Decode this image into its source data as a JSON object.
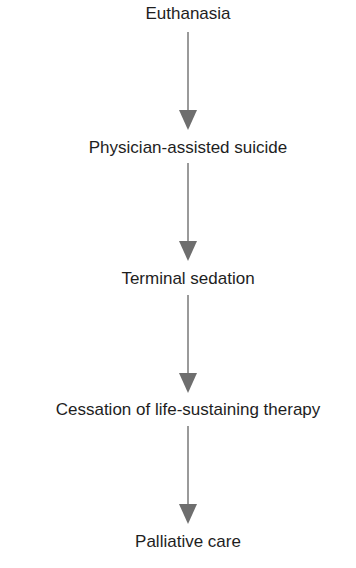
{
  "diagram": {
    "type": "vertical-flow",
    "colors": {
      "text": "#1e1e1e",
      "arrow_line": "#9a9a9a",
      "arrow_head": "#6e6e6e",
      "background": "#ffffff"
    },
    "nodes": [
      {
        "id": "euthanasia",
        "label": "Euthanasia"
      },
      {
        "id": "physician-assisted-suicide",
        "label": "Physician-assisted suicide"
      },
      {
        "id": "terminal-sedation",
        "label": "Terminal sedation"
      },
      {
        "id": "cessation-of-life-sustaining-therapy",
        "label": "Cessation of life-sustaining therapy"
      },
      {
        "id": "palliative-care",
        "label": "Palliative care"
      }
    ],
    "edges": [
      {
        "from": "euthanasia",
        "to": "physician-assisted-suicide"
      },
      {
        "from": "physician-assisted-suicide",
        "to": "terminal-sedation"
      },
      {
        "from": "terminal-sedation",
        "to": "cessation-of-life-sustaining-therapy"
      },
      {
        "from": "cessation-of-life-sustaining-therapy",
        "to": "palliative-care"
      }
    ]
  }
}
